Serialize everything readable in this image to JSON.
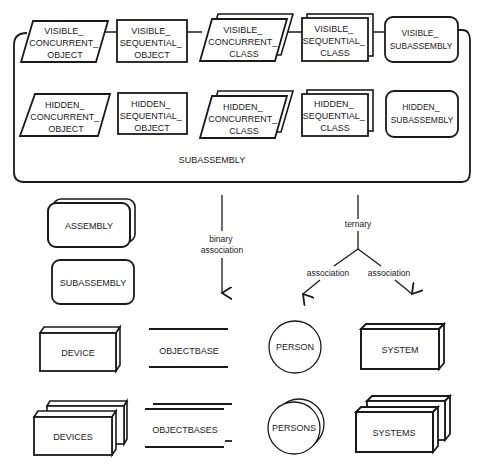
{
  "container": {
    "label": "SUBASSEMBLY",
    "visible_row": [
      {
        "shape": "parallelogram",
        "lines": [
          "VISIBLE_",
          "CONCURRENT_",
          "OBJECT"
        ]
      },
      {
        "shape": "rectangle",
        "lines": [
          "VISIBLE_",
          "SEQUENTIAL_",
          "OBJECT"
        ]
      },
      {
        "shape": "stacked-parallelogram",
        "lines": [
          "VISIBLE_",
          "CONCURRENT_",
          "CLASS"
        ]
      },
      {
        "shape": "stacked-rectangle",
        "lines": [
          "VISIBLE_",
          "SEQUENTIAL_",
          "CLASS"
        ]
      },
      {
        "shape": "rounded-rectangle",
        "lines": [
          "VISIBLE_",
          "SUBASSEMBLY"
        ]
      }
    ],
    "hidden_row": [
      {
        "shape": "parallelogram",
        "lines": [
          "HIDDEN_",
          "CONCURRENT_",
          "OBJECT"
        ]
      },
      {
        "shape": "rectangle",
        "lines": [
          "HIDDEN_",
          "SEQUENTIAL_",
          "OBJECT"
        ]
      },
      {
        "shape": "stacked-parallelogram",
        "lines": [
          "HIDDEN_",
          "CONCURRENT_",
          "CLASS"
        ]
      },
      {
        "shape": "stacked-rectangle",
        "lines": [
          "HIDDEN_",
          "SEQUENTIAL_",
          "CLASS"
        ]
      },
      {
        "shape": "rounded-rectangle",
        "lines": [
          "HIDDEN_",
          "SUBASSEMBLY"
        ]
      }
    ]
  },
  "legend": {
    "assembly": "ASSEMBLY",
    "subassembly": "SUBASSEMBLY",
    "binary": [
      "binary",
      "association"
    ],
    "ternary": "ternary",
    "assoc_left": "association",
    "assoc_right": "association",
    "device": "DEVICE",
    "devices": "DEVICES",
    "objectbase": "OBJECTBASE",
    "objectbases": "OBJECTBASES",
    "person": "PERSON",
    "persons": "PERSONS",
    "system": "SYSTEM",
    "systems": "SYSTEMS"
  }
}
